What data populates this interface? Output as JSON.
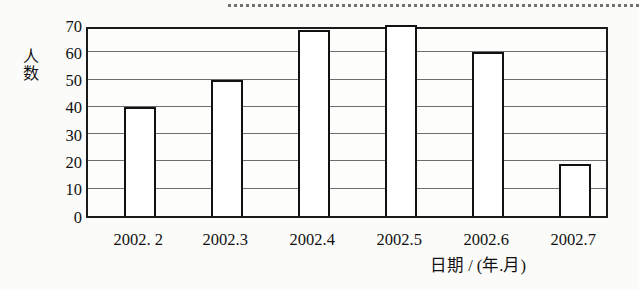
{
  "figure": {
    "background_color": "#fbfbf9",
    "axis_color": "#1a1a1a",
    "grid_color": "#6e6e6e",
    "bar_outline_color": "#111111",
    "bar_fill_color": "#ffffff",
    "scan_artifact": "dashed-rule-top"
  },
  "chart_data": {
    "type": "bar",
    "title": "",
    "subtitle": "",
    "categories": [
      "2002. 2",
      "2002.3",
      "2002.4",
      "2002.5",
      "2002.6",
      "2002.7"
    ],
    "values": [
      40,
      50,
      68,
      70,
      60,
      19
    ],
    "xlabel": "日期 / (年.月)",
    "ylabel": "人数",
    "ylim": [
      0,
      70
    ],
    "ytick_values": [
      0,
      10,
      20,
      30,
      40,
      50,
      60,
      70
    ],
    "ytick_labels": [
      "0",
      "10",
      "20",
      "30",
      "40",
      "50",
      "60",
      "70"
    ],
    "ytick_step": 10,
    "grid": "horizontal",
    "legend": "none",
    "bar_style": "hollow-outlined"
  }
}
